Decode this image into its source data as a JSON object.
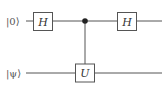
{
  "circuit": {
    "qubits": [
      {
        "label": "|0⟩",
        "y": 21
      },
      {
        "label": "|ψ⟩",
        "y": 73
      }
    ],
    "gates": [
      {
        "name": "H",
        "qubit": 0,
        "x": 43
      },
      {
        "name": "U",
        "qubit": 1,
        "x": 85,
        "control_qubit": 0
      },
      {
        "name": "H",
        "qubit": 0,
        "x": 127
      }
    ],
    "colors": {
      "line": "#555555",
      "text": "#333333",
      "background": "#ffffff"
    }
  },
  "labels": {
    "q0": "|0⟩",
    "q1": "|ψ⟩",
    "gate1": "H",
    "gate2": "U",
    "gate3": "H"
  }
}
